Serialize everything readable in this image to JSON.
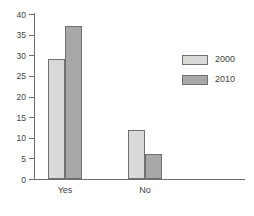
{
  "chart_data": {
    "type": "bar",
    "title": "",
    "subtitle": "",
    "xlabel": "",
    "ylabel": "",
    "categories": [
      "Yes",
      "No"
    ],
    "series": [
      {
        "name": "2000",
        "values": [
          29,
          12
        ],
        "color": "#d9d9d7"
      },
      {
        "name": "2010",
        "values": [
          37,
          6
        ],
        "color": "#a8a8a6"
      }
    ],
    "ylim": [
      0,
      40
    ],
    "ytick_labels": [
      "40",
      "35",
      "30",
      "25",
      "20",
      "15",
      "10",
      "5",
      "0"
    ],
    "ytick_values": [
      40,
      35,
      30,
      25,
      20,
      15,
      10,
      5,
      0
    ],
    "grid": false,
    "legend_position": "upper-right",
    "annotations": []
  },
  "axes": {
    "y": {
      "ticks": [
        {
          "label": "40",
          "value": 40
        },
        {
          "label": "35",
          "value": 35
        },
        {
          "label": "30",
          "value": 30
        },
        {
          "label": "25",
          "value": 25
        },
        {
          "label": "20",
          "value": 20
        },
        {
          "label": "15",
          "value": 15
        },
        {
          "label": "10",
          "value": 10
        },
        {
          "label": "5",
          "value": 5
        },
        {
          "label": "0",
          "value": 0
        }
      ]
    },
    "x": {
      "categories": [
        {
          "label": "Yes"
        },
        {
          "label": "No"
        }
      ]
    }
  },
  "legend": {
    "entries": [
      {
        "label": "2000",
        "color": "#d9d9d7"
      },
      {
        "label": "2010",
        "color": "#a8a8a6"
      }
    ]
  },
  "colors": {
    "series_2000": "#d9d9d7",
    "series_2010": "#a8a8a6",
    "bar_outline": "#70706f",
    "axis": "#6e6e6e",
    "text": "#3f3f3f",
    "background": "#ffffff"
  }
}
